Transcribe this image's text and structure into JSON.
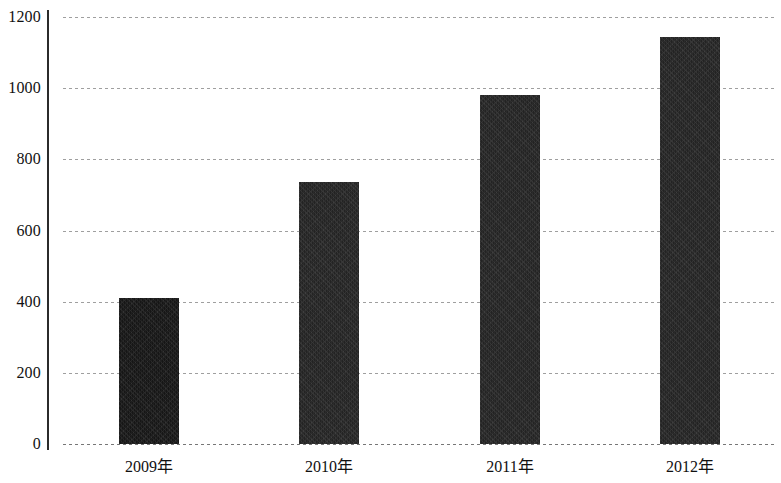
{
  "chart_data": {
    "type": "bar",
    "title": "",
    "subtitle": "",
    "xlabel": "",
    "ylabel": "",
    "categories": [
      "2009年",
      "2010年",
      "2011年",
      "2012年"
    ],
    "values": [
      410,
      735,
      980,
      1145
    ],
    "series": [
      {
        "name": "",
        "values": [
          410,
          735,
          980,
          1145
        ]
      }
    ],
    "ylim": [
      0,
      1200
    ],
    "yticks": [
      0,
      200,
      400,
      600,
      800,
      1000,
      1200
    ],
    "ytick_labels": [
      "0",
      "200",
      "400",
      "600",
      "800",
      "1000",
      "1200"
    ],
    "grid": true,
    "grid_style": "dotted-horizontal",
    "legend": false,
    "legend_position": "none",
    "annotations": [],
    "bar_color": "#232323",
    "grid_color": "#9a9a9a",
    "axis_color": "#2b2b2b",
    "background_color": "#ffffff"
  },
  "axes": {
    "y_axis_name": "value-axis",
    "x_axis_name": "year-axis"
  }
}
